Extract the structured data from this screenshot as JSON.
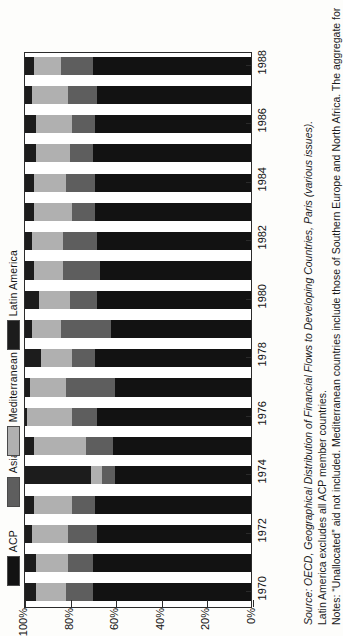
{
  "legend": {
    "position": "left",
    "items": [
      {
        "label": "ACP",
        "color": "#121212",
        "name": "acp"
      },
      {
        "label": "Asia",
        "color": "#5e5e5e",
        "name": "asia"
      },
      {
        "label": "Mediterranean",
        "color": "#b0b0b0",
        "name": "mediterranean"
      },
      {
        "label": "Latin America",
        "color": "#1c1c1c",
        "name": "latin-america"
      }
    ]
  },
  "axes": {
    "value_ticks": [
      "100%",
      "80%",
      "60%",
      "40%",
      "20%",
      "0%"
    ],
    "value_tick_values": [
      100,
      80,
      60,
      40,
      20,
      0
    ],
    "category_ticks": [
      "1970",
      "1972",
      "1974",
      "1976",
      "1978",
      "1980",
      "1982",
      "1984",
      "1986",
      "1988"
    ]
  },
  "notes": {
    "line1_label": "Notes:",
    "line1": "Notes: “Unallocated” aid not included. Mediterranean countries include those of Southern Europe and North Africa. The aggregate for",
    "line2": "Latin America excludes all ACP member countries.",
    "line3_label": "Source:",
    "line3_rest": "OECD, Geographical Distribution of Financial Flows to Developing Countries, Paris (various issues)."
  },
  "chart_data": {
    "type": "bar",
    "orientation": "horizontal-stacked-rotated",
    "title": "",
    "xlabel": "",
    "ylabel": "",
    "ylim": [
      0,
      100
    ],
    "grid": false,
    "legend_position": "left",
    "stack_order_from_100_percent": [
      "Latin America",
      "Mediterranean",
      "Asia",
      "ACP"
    ],
    "categories": [
      "1970",
      "1971",
      "1972",
      "1973",
      "1974",
      "1975",
      "1976",
      "1977",
      "1978",
      "1979",
      "1980",
      "1981",
      "1982",
      "1983",
      "1984",
      "1985",
      "1986",
      "1987",
      "1988"
    ],
    "series": [
      {
        "name": "ACP",
        "color": "#121212",
        "values": [
          70,
          70,
          68,
          69,
          60,
          61,
          68,
          60,
          69,
          62,
          68,
          67,
          68,
          69,
          69,
          70,
          69,
          68,
          70
        ]
      },
      {
        "name": "Asia",
        "color": "#5e5e5e",
        "values": [
          12,
          11,
          13,
          10,
          6,
          12,
          11,
          22,
          10,
          22,
          12,
          16,
          15,
          10,
          13,
          10,
          10,
          13,
          14
        ]
      },
      {
        "name": "Mediterranean",
        "color": "#b0b0b0",
        "values": [
          13,
          14,
          16,
          17,
          5,
          23,
          20,
          16,
          14,
          13,
          14,
          13,
          14,
          17,
          14,
          15,
          16,
          16,
          12
        ]
      },
      {
        "name": "Latin America",
        "color": "#1c1c1c",
        "values": [
          5,
          5,
          3,
          4,
          29,
          4,
          1,
          2,
          7,
          3,
          6,
          4,
          3,
          4,
          4,
          5,
          5,
          3,
          4
        ]
      }
    ]
  }
}
